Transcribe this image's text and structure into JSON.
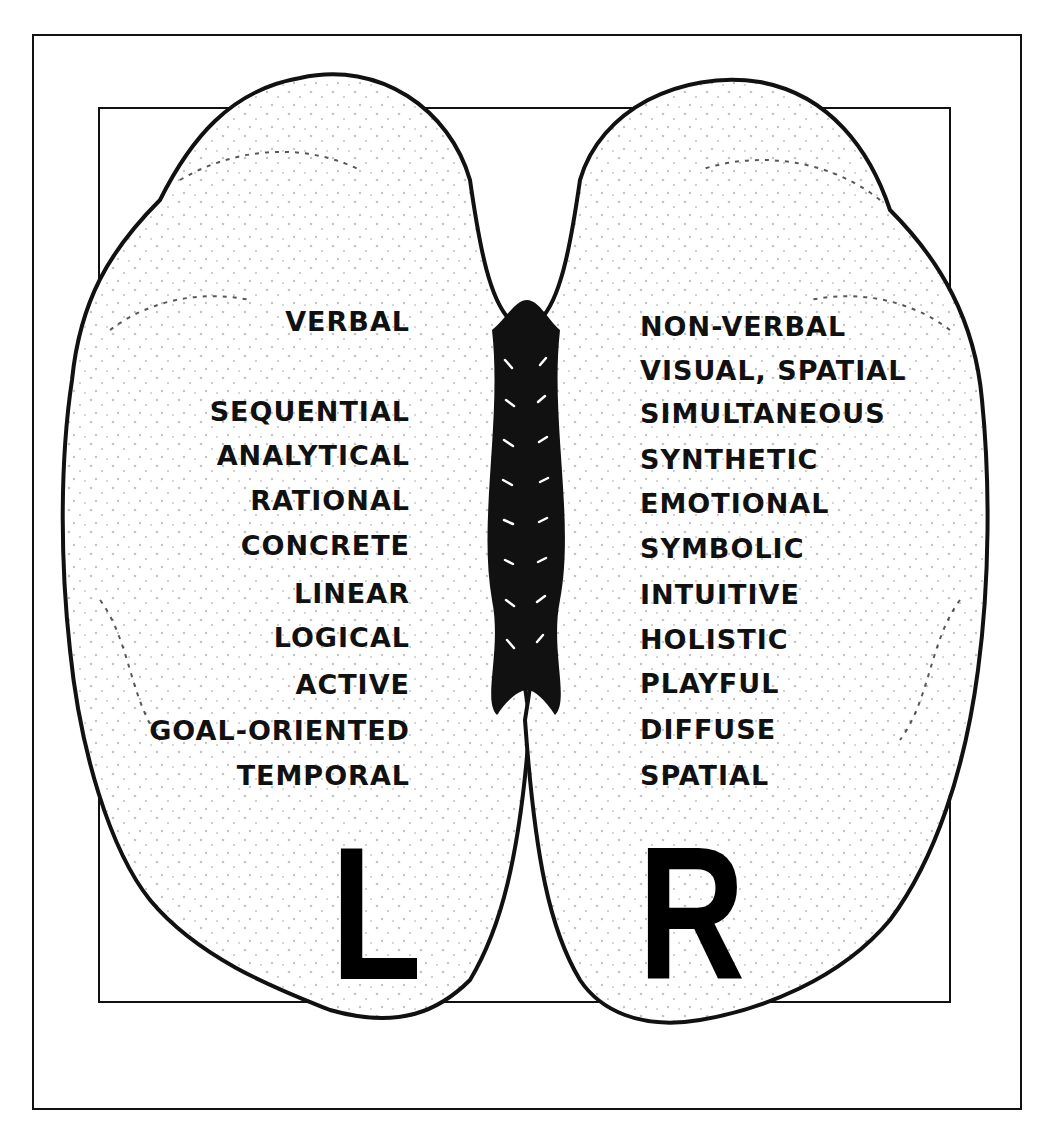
{
  "figure": {
    "left_hemisphere": {
      "letter": "L",
      "traits": [
        "VERBAL",
        "SEQUENTIAL",
        "ANALYTICAL",
        "RATIONAL",
        "CONCRETE",
        "LINEAR",
        "LOGICAL",
        "ACTIVE",
        "GOAL-ORIENTED",
        "TEMPORAL"
      ]
    },
    "right_hemisphere": {
      "letter": "R",
      "traits": [
        "NON-VERBAL",
        "VISUAL, SPATIAL",
        "SIMULTANEOUS",
        "SYNTHETIC",
        "EMOTIONAL",
        "SYMBOLIC",
        "INTUITIVE",
        "HOLISTIC",
        "PLAYFUL",
        "DIFFUSE",
        "SPATIAL"
      ]
    },
    "colors": {
      "ink": "#111111",
      "paper": "#ffffff"
    }
  }
}
